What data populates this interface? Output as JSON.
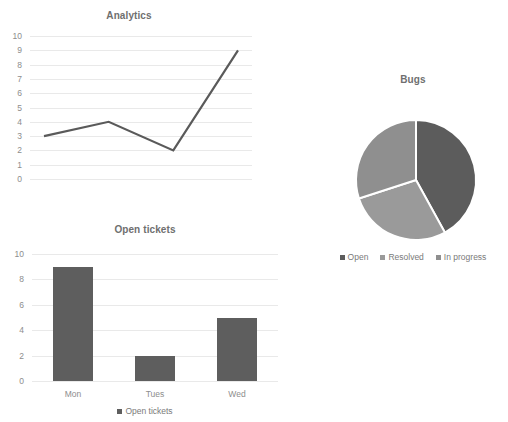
{
  "charts": {
    "line": {
      "title": "Analytics"
    },
    "bar": {
      "title": "Open tickets"
    },
    "pie": {
      "title": "Bugs"
    }
  },
  "chart_data": [
    {
      "type": "line",
      "title": "Analytics",
      "xlabel": "",
      "ylabel": "",
      "x": [
        1,
        2,
        3,
        4
      ],
      "values": [
        3,
        4,
        2,
        9
      ],
      "series": [
        {
          "name": "Analytics",
          "values": [
            3,
            4,
            2,
            9
          ]
        }
      ],
      "ylim": [
        0,
        10
      ],
      "yticks": [
        0,
        1,
        2,
        3,
        4,
        5,
        6,
        7,
        8,
        9,
        10
      ],
      "ytick_labels": [
        "0",
        "1",
        "2",
        "3",
        "4",
        "5",
        "6",
        "7",
        "8",
        "9",
        "10"
      ],
      "grid": true,
      "legend": false,
      "line_color": "#5a5a5a",
      "grid_color": "#e9e9e9"
    },
    {
      "type": "bar",
      "title": "Open tickets",
      "xlabel": "",
      "ylabel": "",
      "categories": [
        "Mon",
        "Tues",
        "Wed"
      ],
      "values": [
        9,
        2,
        5
      ],
      "series": [
        {
          "name": "Open tickets",
          "values": [
            9,
            2,
            5
          ]
        }
      ],
      "ylim": [
        0,
        10
      ],
      "yticks": [
        0,
        2,
        4,
        6,
        8,
        10
      ],
      "ytick_labels": [
        "0",
        "2",
        "4",
        "6",
        "8",
        "10"
      ],
      "grid": true,
      "legend": true,
      "legend_position": "bottom",
      "legend_entries": [
        {
          "label": "Open tickets",
          "color": "#5e5e5e"
        }
      ],
      "bar_color": "#5e5e5e",
      "grid_color": "#e9e9e9"
    },
    {
      "type": "pie",
      "title": "Bugs",
      "labels": [
        "Open",
        "Resolved",
        "In progress"
      ],
      "values": [
        42,
        28,
        30
      ],
      "colors": [
        "#5c5c5c",
        "#9a9a9a",
        "#8f8f8f"
      ],
      "legend": true,
      "legend_position": "bottom",
      "legend_entries": [
        {
          "label": "Open",
          "color": "#5c5c5c"
        },
        {
          "label": "Resolved",
          "color": "#9a9a9a"
        },
        {
          "label": "In progress",
          "color": "#8f8f8f"
        }
      ],
      "start_angle": 0,
      "slice_border_color": "#ffffff"
    }
  ]
}
